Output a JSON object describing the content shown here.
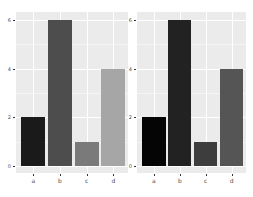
{
  "chart_data": [
    {
      "type": "bar",
      "title": "",
      "xlabel": "",
      "ylabel": "",
      "categories": [
        "a",
        "b",
        "c",
        "d"
      ],
      "values": [
        2,
        6,
        1,
        4
      ],
      "colors": [
        "#1a1a1a",
        "#4d4d4d",
        "#7a7a7a",
        "#a6a6a6"
      ],
      "yticks": [
        "0",
        "2",
        "4",
        "6"
      ],
      "ylim": [
        0,
        6.3
      ],
      "grid": true,
      "legend": "none"
    },
    {
      "type": "bar",
      "title": "",
      "xlabel": "",
      "ylabel": "",
      "categories": [
        "a",
        "b",
        "c",
        "d"
      ],
      "values": [
        2,
        6,
        1,
        4
      ],
      "colors": [
        "#050505",
        "#222222",
        "#3d3d3d",
        "#555555"
      ],
      "yticks": [
        "0",
        "2",
        "4",
        "6"
      ],
      "ylim": [
        0,
        6.3
      ],
      "grid": true,
      "legend": "none"
    }
  ]
}
